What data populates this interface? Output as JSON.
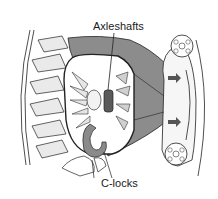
{
  "diagram": {
    "labels": {
      "axleshafts": "Axleshafts",
      "clocks": "C-locks"
    },
    "colors": {
      "housing_gray": "#8c8c8c",
      "clock_gray": "#8a8a8a",
      "axle_end_dark": "#5a5a5a",
      "line": "#222222",
      "gear_fill": "#e6e6e6",
      "background": "#ffffff"
    }
  }
}
